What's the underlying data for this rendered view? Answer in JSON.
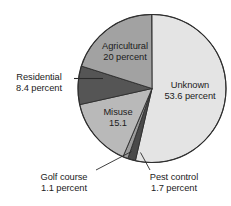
{
  "chart_data": {
    "type": "pie",
    "title": "",
    "subtitle": "",
    "xlabel": "",
    "ylabel": "",
    "legend_position": "none",
    "grid": false,
    "units": "percent",
    "start_angle_deg": 0,
    "direction": "clockwise",
    "total": 100,
    "categories": [
      "Unknown",
      "Pest control",
      "Golf course",
      "Misuse",
      "Residential",
      "Agricultural"
    ],
    "values": [
      53.6,
      1.7,
      1.1,
      15.1,
      8.4,
      20
    ],
    "colors": [
      "#e4e4e4",
      "#4a4a4a",
      "#9b9b9b",
      "#b9b9b9",
      "#555555",
      "#a2a2a2"
    ],
    "slices": [
      {
        "name": "Unknown",
        "value": 53.6,
        "color": "#e4e4e4",
        "label_line1": "Unknown",
        "label_line2": "53.6 percent",
        "label_placement": "inside"
      },
      {
        "name": "Pest control",
        "value": 1.7,
        "color": "#4a4a4a",
        "label_line1": "Pest control",
        "label_line2": "1.7 percent",
        "label_placement": "outside"
      },
      {
        "name": "Golf course",
        "value": 1.1,
        "color": "#9b9b9b",
        "label_line1": "Golf course",
        "label_line2": "1.1 percent",
        "label_placement": "outside"
      },
      {
        "name": "Misuse",
        "value": 15.1,
        "color": "#b9b9b9",
        "label_line1": "Misuse",
        "label_line2": "15.1",
        "label_placement": "inside"
      },
      {
        "name": "Residential",
        "value": 8.4,
        "color": "#555555",
        "label_line1": "Residential",
        "label_line2": "8.4 percent",
        "label_placement": "outside"
      },
      {
        "name": "Agricultural",
        "value": 20,
        "color": "#a2a2a2",
        "label_line1": "Agricultural",
        "label_line2": "20 percent",
        "label_placement": "inside"
      }
    ]
  },
  "labels": {
    "agricultural": {
      "line1": "Agricultural",
      "line2": "20 percent"
    },
    "unknown": {
      "line1": "Unknown",
      "line2": "53.6 percent"
    },
    "misuse": {
      "line1": "Misuse",
      "line2": "15.1"
    },
    "residential": {
      "line1": "Residential",
      "line2": "8.4 percent"
    },
    "golf_course": {
      "line1": "Golf course",
      "line2": "1.1 percent"
    },
    "pest_control": {
      "line1": "Pest control",
      "line2": "1.7 percent"
    }
  }
}
